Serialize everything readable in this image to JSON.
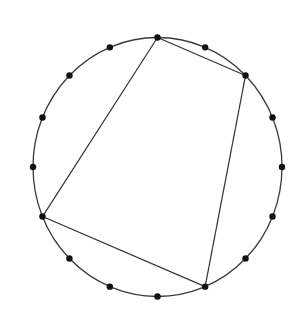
{
  "diagram": {
    "type": "inscribed-polygon",
    "circle": {
      "cx": 157.5,
      "cy": 167,
      "rx": 124.5,
      "ry": 129.5,
      "stroke": "#3a3a3a"
    },
    "point_count": 16,
    "point_radius": 3.2,
    "point_color": "#111111",
    "start_angle_deg": 0,
    "direction": "clockwise-from-top",
    "polygon_vertex_indices": [
      0,
      2,
      7,
      11
    ],
    "edge_color": "#333333"
  }
}
